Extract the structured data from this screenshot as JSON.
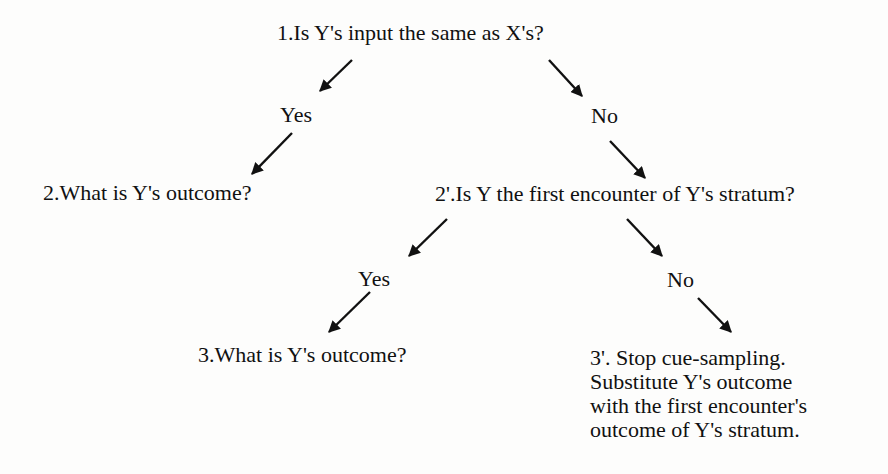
{
  "diagram": {
    "type": "decision-tree",
    "nodes": {
      "q1": "1.Is Y's input the same as X's?",
      "q1_yes": "Yes",
      "q1_no": "No",
      "q2": "2.What is Y's outcome?",
      "q2p": "2'.Is Y the first encounter of Y's stratum?",
      "q2p_yes": "Yes",
      "q2p_no": "No",
      "q3": "3.What is Y's outcome?",
      "q3p": {
        "lines": [
          "3'. Stop cue-sampling.",
          "Substitute Y's outcome",
          "with the first encounter's",
          "outcome of Y's stratum."
        ]
      }
    },
    "edges": [
      {
        "from": "q1",
        "to": "q1_yes"
      },
      {
        "from": "q1",
        "to": "q1_no"
      },
      {
        "from": "q1_yes",
        "to": "q2"
      },
      {
        "from": "q1_no",
        "to": "q2p"
      },
      {
        "from": "q2p",
        "to": "q2p_yes"
      },
      {
        "from": "q2p",
        "to": "q2p_no"
      },
      {
        "from": "q2p_yes",
        "to": "q3"
      },
      {
        "from": "q2p_no",
        "to": "q3p"
      }
    ],
    "colors": {
      "text": "#111111",
      "arrow": "#111111",
      "background": "#fdfdfc"
    }
  }
}
